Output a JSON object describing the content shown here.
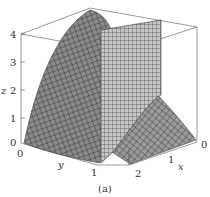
{
  "figure": {
    "caption": "(a)"
  },
  "axes": {
    "z": {
      "label": "z",
      "ticks": [
        "0",
        "1",
        "2",
        "3",
        "4"
      ]
    },
    "y": {
      "label": "y",
      "ticks": [
        "0",
        "1"
      ]
    },
    "x": {
      "label": "x",
      "ticks": [
        "0",
        "1",
        "2"
      ]
    }
  },
  "colors": {
    "surface": "#8c8c8c",
    "surface_dark": "#6e6e6e",
    "mesh": "#2a2a2a",
    "plane": "#b8b8b8",
    "box": "#555555"
  }
}
